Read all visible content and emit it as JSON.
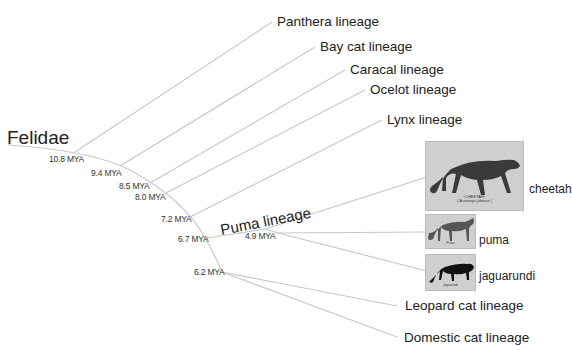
{
  "diagram": {
    "type": "phylogenetic-tree",
    "root": {
      "label": "Felidae"
    },
    "nodes": [
      {
        "id": "n108",
        "age": "10.8 MYA",
        "children": [
          "Panthera lineage"
        ]
      },
      {
        "id": "n94",
        "age": "9.4 MYA",
        "children": [
          "Bay cat lineage"
        ]
      },
      {
        "id": "n85",
        "age": "8.5 MYA",
        "children": [
          "Caracal lineage"
        ]
      },
      {
        "id": "n80",
        "age": "8.0 MYA",
        "children": [
          "Ocelot lineage"
        ]
      },
      {
        "id": "n72",
        "age": "7.2 MYA",
        "children": [
          "Lynx lineage"
        ]
      },
      {
        "id": "n67",
        "age": "6.7 MYA",
        "children": [
          "Puma lineage"
        ]
      },
      {
        "id": "n49",
        "age": "4.9 MYA",
        "children": [
          "cheetah",
          "puma",
          "jaguarundi"
        ]
      },
      {
        "id": "n62",
        "age": "6.2 MYA",
        "children": [
          "Leopard cat lineage",
          "Domestic cat lineage"
        ]
      }
    ],
    "lineages": [
      {
        "label": "Panthera lineage"
      },
      {
        "label": "Bay cat lineage"
      },
      {
        "label": "Caracal lineage"
      },
      {
        "label": "Ocelot lineage"
      },
      {
        "label": "Lynx lineage"
      },
      {
        "label": "Puma lineage"
      },
      {
        "label": "Leopard cat lineage"
      },
      {
        "label": "Domestic cat lineage"
      }
    ],
    "species": [
      {
        "label": "cheetah",
        "image_caption_title": "~CHEETAH~",
        "image_caption_sub": "( Acinonyx jubatus )"
      },
      {
        "label": "puma",
        "image_caption_title": "Puma",
        "image_caption_sub": "(Puma concolor)"
      },
      {
        "label": "jaguarundi",
        "image_caption_title": "Jaguarundi",
        "image_caption_sub": "(Puma yagouaroundi)"
      }
    ],
    "colors": {
      "branch": "#c8c8c8",
      "text": "#222222",
      "photo_bg": "#cfcfcf"
    }
  }
}
